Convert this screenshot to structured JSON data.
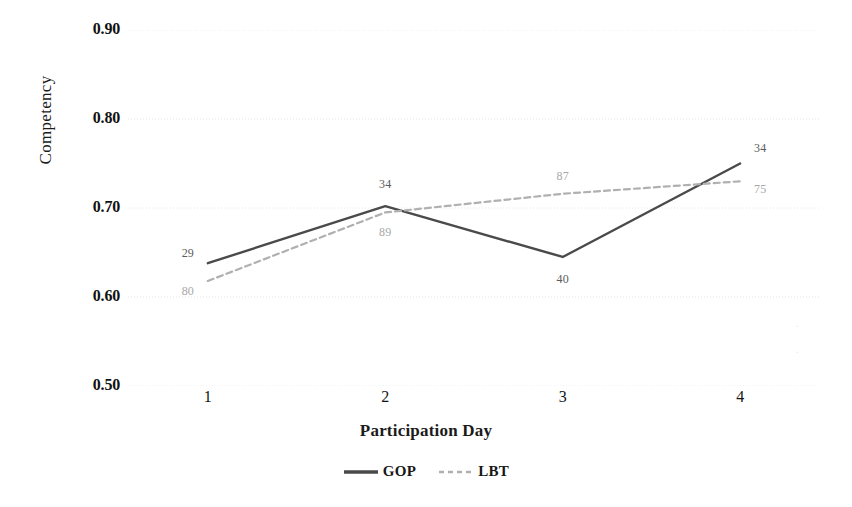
{
  "chart_data": {
    "type": "line",
    "title": "",
    "xlabel": "Participation Day",
    "ylabel": "Competency",
    "categories": [
      "1",
      "2",
      "3",
      "4"
    ],
    "x": [
      1,
      2,
      3,
      4
    ],
    "xlim": [
      0.55,
      4.45
    ],
    "ylim": [
      0.5,
      0.9
    ],
    "yticks": [
      "0.90",
      "0.80",
      "0.70",
      "0.60",
      "0.50"
    ],
    "ytick_values": [
      0.9,
      0.8,
      0.7,
      0.6,
      0.5
    ],
    "grid": "horizontal-dotted",
    "legend_position": "bottom-center",
    "series": [
      {
        "name": "GOP",
        "style": "solid",
        "color": "#4a4a4a",
        "values": [
          0.638,
          0.702,
          0.645,
          0.75
        ],
        "point_labels": [
          "29",
          "34",
          "40",
          "34"
        ]
      },
      {
        "name": "LBT",
        "style": "dashed",
        "color": "#b0b0b0",
        "values": [
          0.618,
          0.695,
          0.716,
          0.73
        ],
        "point_labels": [
          "80",
          "89",
          "87",
          "75"
        ]
      }
    ]
  },
  "legend": {
    "items": [
      {
        "label": "GOP",
        "color": "#4a4a4a",
        "style": "solid"
      },
      {
        "label": "LBT",
        "color": "#b0b0b0",
        "style": "dashed"
      }
    ]
  },
  "artifacts": {
    "right_margin_mark_top": "·",
    "right_margin_mark_bottom": "·"
  }
}
